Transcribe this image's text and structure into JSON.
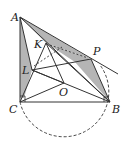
{
  "figure": {
    "type": "geometry-diagram",
    "points": {
      "A": {
        "label": "A",
        "x": 20,
        "y": 17,
        "lx": 11,
        "ly": 21
      },
      "C": {
        "label": "C",
        "x": 20,
        "y": 102,
        "lx": 9,
        "ly": 112
      },
      "B": {
        "label": "B",
        "x": 110,
        "y": 102,
        "lx": 112,
        "ly": 112
      },
      "K": {
        "label": "K",
        "x": 46,
        "y": 43,
        "lx": 34,
        "ly": 49
      },
      "P": {
        "label": "P",
        "x": 91,
        "y": 59,
        "lx": 93,
        "ly": 54
      },
      "L": {
        "label": "L",
        "x": 32,
        "y": 70,
        "lx": 22,
        "ly": 74
      },
      "O": {
        "label": "O",
        "x": 64,
        "y": 83,
        "lx": 58,
        "ly": 96
      }
    },
    "colors": {
      "stroke": "#333333",
      "shade": "#b5b5b5",
      "background": "#ffffff"
    },
    "circle": {
      "cx": 65,
      "cy": 96,
      "r": 45,
      "style": "dashed"
    }
  }
}
